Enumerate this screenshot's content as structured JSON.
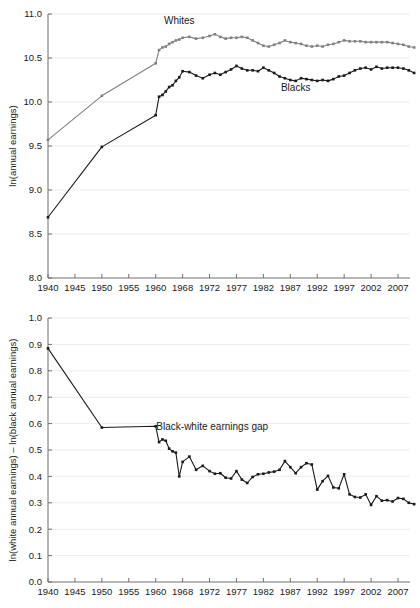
{
  "figure": {
    "background": "#ffffff",
    "width": 420,
    "height": 608
  },
  "colors": {
    "blacks": "#1a1a1a",
    "whites": "#808086",
    "gap": "#1a1a1a",
    "grid": "#e8e8ea",
    "axis": "#6f6f74",
    "text": "#1a1a1a"
  },
  "panels": {
    "top": {
      "name": "earnings-levels-panel",
      "ylabel": "ln(annual earnings)",
      "ylim": [
        8.0,
        11.0
      ],
      "yticks": [
        "8.0",
        "8.5",
        "9.0",
        "9.5",
        "10.0",
        "10.5",
        "11.0"
      ],
      "ytick_values": [
        8.0,
        8.5,
        9.0,
        9.5,
        10.0,
        10.5,
        11.0
      ],
      "xticks": [
        "1940",
        "1945",
        "1950",
        "1955",
        "1960",
        "1968",
        "1972",
        "1977",
        "1982",
        "1987",
        "1992",
        "1997",
        "2002",
        "2007"
      ],
      "xtick_values": [
        1940,
        1945,
        1950,
        1955,
        1960,
        1968,
        1972,
        1977,
        1982,
        1987,
        1992,
        1997,
        2002,
        2007
      ],
      "annotations": [
        {
          "text": "Whites",
          "x": 1967.0,
          "y": 10.89
        },
        {
          "text": "Blacks",
          "x": 1988.0,
          "y": 10.12
        }
      ]
    },
    "bottom": {
      "name": "earnings-gap-panel",
      "ylabel": "ln(white annual earnings) – ln(black annual earnings)",
      "ylim": [
        0.0,
        1.0
      ],
      "yticks": [
        "0.0",
        "0.1",
        "0.2",
        "0.3",
        "0.4",
        "0.5",
        "0.6",
        "0.7",
        "0.8",
        "0.9",
        "1.0"
      ],
      "ytick_values": [
        0.0,
        0.1,
        0.2,
        0.3,
        0.4,
        0.5,
        0.6,
        0.7,
        0.8,
        0.9,
        1.0
      ],
      "xticks": [
        "1940",
        "1945",
        "1950",
        "1955",
        "1960",
        "1968",
        "1972",
        "1977",
        "1982",
        "1987",
        "1992",
        "1997",
        "2002",
        "2007"
      ],
      "xtick_values": [
        1940,
        1945,
        1950,
        1955,
        1960,
        1968,
        1972,
        1977,
        1982,
        1987,
        1992,
        1997,
        2002,
        2007
      ],
      "annotations": [
        {
          "text": "Black-white earnings gap",
          "x": 1972.5,
          "y": 0.575
        }
      ]
    }
  },
  "chart_data": [
    {
      "type": "line",
      "title": "",
      "xlabel": "",
      "ylabel": "ln(annual earnings)",
      "xlim": [
        1940,
        2010
      ],
      "ylim": [
        8.0,
        11.0
      ],
      "grid": true,
      "legend": "inline-annotations",
      "x": [
        1940,
        1950,
        1960,
        1961,
        1962,
        1963,
        1964,
        1965,
        1966,
        1967,
        1968,
        1969,
        1970,
        1971,
        1972,
        1973,
        1974,
        1975,
        1976,
        1977,
        1978,
        1979,
        1980,
        1981,
        1982,
        1983,
        1984,
        1985,
        1986,
        1987,
        1988,
        1989,
        1990,
        1991,
        1992,
        1993,
        1994,
        1995,
        1996,
        1997,
        1998,
        1999,
        2000,
        2001,
        2002,
        2003,
        2004,
        2005,
        2006,
        2007,
        2008,
        2009,
        2010
      ],
      "series": [
        {
          "name": "Whites",
          "color": "#808086",
          "marker": "square",
          "values": [
            9.57,
            10.07,
            10.44,
            10.59,
            10.62,
            10.63,
            10.66,
            10.68,
            10.7,
            10.71,
            10.73,
            10.74,
            10.72,
            10.73,
            10.75,
            10.77,
            10.74,
            10.72,
            10.73,
            10.73,
            10.74,
            10.73,
            10.7,
            10.67,
            10.64,
            10.63,
            10.65,
            10.67,
            10.7,
            10.68,
            10.67,
            10.66,
            10.64,
            10.63,
            10.64,
            10.63,
            10.65,
            10.66,
            10.68,
            10.7,
            10.69,
            10.69,
            10.69,
            10.68,
            10.68,
            10.68,
            10.68,
            10.68,
            10.67,
            10.66,
            10.65,
            10.63,
            10.62
          ]
        },
        {
          "name": "Blacks",
          "color": "#1a1a1a",
          "marker": "square",
          "values": [
            8.69,
            9.49,
            9.85,
            10.06,
            10.08,
            10.12,
            10.17,
            10.19,
            10.24,
            10.28,
            10.35,
            10.34,
            10.3,
            10.27,
            10.31,
            10.33,
            10.31,
            10.34,
            10.37,
            10.41,
            10.38,
            10.36,
            10.36,
            10.35,
            10.39,
            10.36,
            10.33,
            10.29,
            10.27,
            10.25,
            10.24,
            10.27,
            10.26,
            10.25,
            10.24,
            10.25,
            10.24,
            10.26,
            10.29,
            10.3,
            10.33,
            10.36,
            10.38,
            10.39,
            10.37,
            10.4,
            10.38,
            10.39,
            10.39,
            10.39,
            10.38,
            10.36,
            10.33
          ]
        }
      ]
    },
    {
      "type": "line",
      "title": "",
      "xlabel": "",
      "ylabel": "ln(white annual earnings) – ln(black annual earnings)",
      "xlim": [
        1940,
        2010
      ],
      "ylim": [
        0.0,
        1.0
      ],
      "grid": true,
      "legend": "inline-annotations",
      "x": [
        1940,
        1950,
        1960,
        1961,
        1962,
        1963,
        1964,
        1965,
        1966,
        1967,
        1968,
        1969,
        1970,
        1971,
        1972,
        1973,
        1974,
        1975,
        1976,
        1977,
        1978,
        1979,
        1980,
        1981,
        1982,
        1983,
        1984,
        1985,
        1986,
        1987,
        1988,
        1989,
        1990,
        1991,
        1992,
        1993,
        1994,
        1995,
        1996,
        1997,
        1998,
        1999,
        2000,
        2001,
        2002,
        2003,
        2004,
        2005,
        2006,
        2007,
        2008,
        2009,
        2010
      ],
      "series": [
        {
          "name": "Black-white earnings gap",
          "color": "#1a1a1a",
          "marker": "square",
          "values": [
            0.885,
            0.585,
            0.59,
            0.53,
            0.54,
            0.535,
            0.505,
            0.495,
            0.49,
            0.4,
            0.455,
            0.475,
            0.425,
            0.44,
            0.42,
            0.41,
            0.412,
            0.395,
            0.392,
            0.42,
            0.388,
            0.375,
            0.398,
            0.408,
            0.41,
            0.415,
            0.418,
            0.425,
            0.458,
            0.435,
            0.412,
            0.435,
            0.45,
            0.445,
            0.35,
            0.382,
            0.402,
            0.358,
            0.355,
            0.408,
            0.332,
            0.322,
            0.32,
            0.332,
            0.292,
            0.325,
            0.308,
            0.31,
            0.305,
            0.318,
            0.315,
            0.3,
            0.295
          ]
        }
      ]
    }
  ]
}
